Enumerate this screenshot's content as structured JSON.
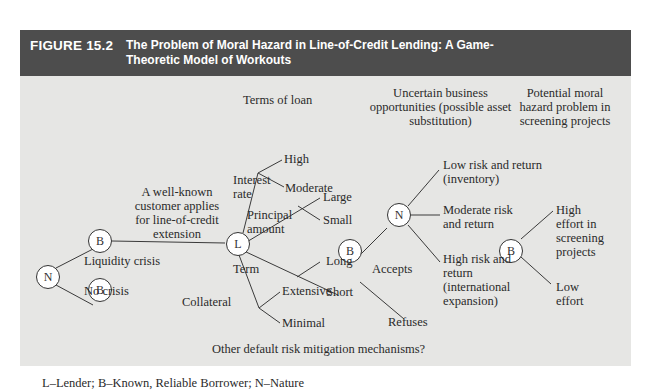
{
  "header": {
    "figure_number": "FIGURE 15.2",
    "title": "The Problem of Moral Hazard in Line-of-Credit Lending: A Game-Theoretic Model of Workouts"
  },
  "column_headers": {
    "terms": "Terms of loan",
    "uncertain": "Uncertain business opportunities (possible asset substitution)",
    "moral_hazard": "Potential moral hazard problem in screening projects"
  },
  "nodes": {
    "nature_root": "N",
    "borrower_crisis": "B",
    "borrower_no_crisis": "B",
    "lender": "L",
    "borrower_accepts": "B",
    "nature_mid": "N",
    "borrower_effort": "B"
  },
  "edges": {
    "liquidity_crisis": "Liquidity crisis",
    "no_crisis": "No crisis",
    "applies": "A well-known customer applies for line-of-credit extension",
    "interest_rate": "Interest rate",
    "principal_amount": "Principal amount",
    "term": "Term",
    "collateral": "Collateral",
    "accepts": "Accepts",
    "refuses": "Refuses"
  },
  "leaves": {
    "high": "High",
    "moderate": "Moderate",
    "large": "Large",
    "small": "Small",
    "long": "Long",
    "short": "Short",
    "extensive": "Extensive",
    "minimal": "Minimal",
    "low_risk": "Low risk and return (inventory)",
    "moderate_risk": "Moderate risk and return",
    "high_risk": "High risk and return (international expansion)",
    "high_effort": "High effort in screening projects",
    "low_effort": "Low effort"
  },
  "other_mechanisms": "Other default risk mitigation mechanisms?",
  "legend": "L–Lender; B–Known, Reliable Borrower; N–Nature"
}
